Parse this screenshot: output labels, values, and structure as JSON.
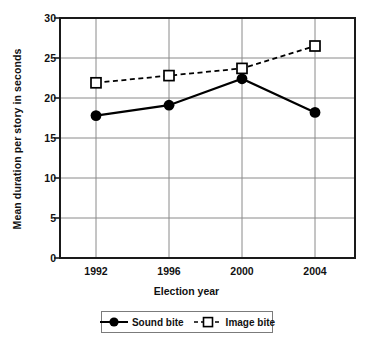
{
  "chart_data": {
    "type": "line",
    "title": "",
    "xlabel": "Election year",
    "ylabel": "Mean duration per story in seconds",
    "categories": [
      "1992",
      "1996",
      "2000",
      "2004"
    ],
    "x": [
      1992,
      1996,
      2000,
      2004
    ],
    "xlim": [
      1990,
      2006
    ],
    "ylim": [
      0,
      30
    ],
    "yticks": [
      0,
      5,
      10,
      15,
      20,
      25,
      30
    ],
    "ytick_labels": [
      "0",
      "5",
      "10",
      "15",
      "20",
      "25",
      "30"
    ],
    "grid": "horizontal-and-vertical",
    "legend_position": "below-axes",
    "series": [
      {
        "name": "Sound bite",
        "values": [
          17.8,
          19.1,
          22.4,
          18.2
        ],
        "marker": "filled-circle",
        "line_style": "solid",
        "color": "#000000"
      },
      {
        "name": "Image bite",
        "values": [
          21.9,
          22.8,
          23.7,
          26.5
        ],
        "marker": "open-square",
        "line_style": "dashed",
        "color": "#000000"
      }
    ]
  },
  "legend": {
    "items": [
      {
        "label": "Sound bite",
        "marker": "filled-circle",
        "line_style": "solid"
      },
      {
        "label": "Image bite",
        "marker": "open-square",
        "line_style": "dashed"
      }
    ]
  },
  "axes": {
    "y_title": "Mean duration per story in seconds",
    "x_title": "Election year",
    "y_labels": [
      "30",
      "25",
      "20",
      "15",
      "10",
      "5",
      "0"
    ],
    "x_labels": [
      "1992",
      "1996",
      "2000",
      "2004"
    ]
  },
  "colors": {
    "axis": "#1a1a1a",
    "grid": "#808080",
    "series": "#000000",
    "background": "#ffffff",
    "legend_border": "#7b7b7b"
  }
}
